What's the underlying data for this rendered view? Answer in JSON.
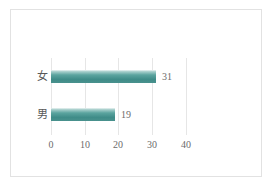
{
  "chart_data": {
    "type": "bar",
    "orientation": "horizontal",
    "title": "",
    "xlabel": "",
    "ylabel": "",
    "categories": [
      "女",
      "男"
    ],
    "values": [
      31,
      19
    ],
    "data_labels": [
      "31",
      "19"
    ],
    "xticks": [
      "0",
      "10",
      "20",
      "30",
      "40"
    ],
    "xtick_values": [
      0,
      10,
      20,
      30,
      40
    ],
    "xlim": [
      0,
      40
    ],
    "grid": "vertical",
    "legend": "none",
    "series": [
      {
        "name": "",
        "values": [
          31,
          19
        ]
      }
    ],
    "colors": {
      "bar_fill": "#3f8c88",
      "bar_highlight": "#a8cfcc",
      "gridline": "#e6e6e6",
      "text": "#6b6b6b",
      "border": "#e2e2e2",
      "background": "#ffffff"
    }
  }
}
